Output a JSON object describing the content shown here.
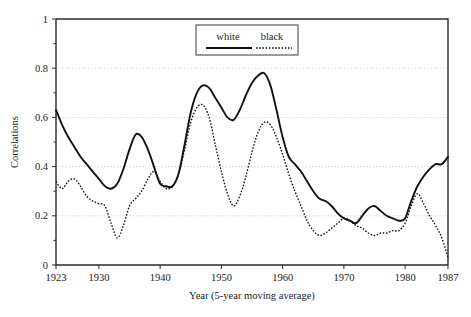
{
  "chart_data": {
    "type": "line",
    "title": "",
    "xlabel": "Year (5-year moving average)",
    "ylabel": "Correlations",
    "xlim": [
      1923,
      1987
    ],
    "ylim": [
      0,
      1
    ],
    "grid": true,
    "legend_position": "top-center",
    "xticks": [
      1923,
      1930,
      1940,
      1950,
      1960,
      1970,
      1980,
      1987
    ],
    "xtick_labels": [
      "1923",
      "1930",
      "1940",
      "1950",
      "1960",
      "1970",
      "1980",
      "1987"
    ],
    "yticks": [
      0,
      0.2,
      0.4,
      0.6,
      0.8,
      1
    ],
    "ytick_labels": [
      "0",
      "0.2",
      "0.4",
      "0.6",
      "0.8",
      "1"
    ],
    "x": [
      1923,
      1924,
      1925,
      1926,
      1927,
      1928,
      1929,
      1930,
      1931,
      1932,
      1933,
      1934,
      1935,
      1936,
      1937,
      1938,
      1939,
      1940,
      1941,
      1942,
      1943,
      1944,
      1945,
      1946,
      1947,
      1948,
      1949,
      1950,
      1951,
      1952,
      1953,
      1954,
      1955,
      1956,
      1957,
      1958,
      1959,
      1960,
      1961,
      1962,
      1963,
      1964,
      1965,
      1966,
      1967,
      1968,
      1969,
      1970,
      1971,
      1972,
      1973,
      1974,
      1975,
      1976,
      1977,
      1978,
      1979,
      1980,
      1981,
      1982,
      1983,
      1984,
      1985,
      1986,
      1987
    ],
    "series": [
      {
        "name": "white",
        "style": "solid",
        "color": "#111111",
        "values": [
          0.63,
          0.57,
          0.52,
          0.48,
          0.44,
          0.41,
          0.38,
          0.35,
          0.32,
          0.31,
          0.33,
          0.39,
          0.47,
          0.53,
          0.52,
          0.47,
          0.4,
          0.33,
          0.32,
          0.32,
          0.37,
          0.49,
          0.62,
          0.7,
          0.73,
          0.72,
          0.68,
          0.64,
          0.6,
          0.59,
          0.63,
          0.69,
          0.74,
          0.77,
          0.78,
          0.73,
          0.63,
          0.52,
          0.44,
          0.41,
          0.38,
          0.34,
          0.3,
          0.27,
          0.26,
          0.24,
          0.21,
          0.19,
          0.18,
          0.17,
          0.2,
          0.23,
          0.24,
          0.22,
          0.2,
          0.19,
          0.18,
          0.19,
          0.26,
          0.32,
          0.36,
          0.39,
          0.41,
          0.41,
          0.44
        ]
      },
      {
        "name": "black",
        "style": "dotted",
        "color": "#111111",
        "values": [
          0.34,
          0.31,
          0.34,
          0.35,
          0.32,
          0.28,
          0.26,
          0.25,
          0.24,
          0.17,
          0.11,
          0.16,
          0.24,
          0.27,
          0.3,
          0.35,
          0.38,
          0.34,
          0.31,
          0.32,
          0.37,
          0.47,
          0.58,
          0.64,
          0.65,
          0.6,
          0.49,
          0.38,
          0.29,
          0.24,
          0.28,
          0.36,
          0.46,
          0.54,
          0.58,
          0.57,
          0.52,
          0.45,
          0.37,
          0.3,
          0.24,
          0.18,
          0.14,
          0.12,
          0.13,
          0.15,
          0.17,
          0.19,
          0.18,
          0.16,
          0.15,
          0.13,
          0.12,
          0.13,
          0.13,
          0.14,
          0.14,
          0.17,
          0.24,
          0.29,
          0.25,
          0.2,
          0.16,
          0.11,
          0.03
        ]
      }
    ],
    "legend": [
      {
        "label": "white",
        "style": "solid"
      },
      {
        "label": "black",
        "style": "dotted"
      }
    ]
  },
  "axes": {
    "ylabel": "Correlations",
    "xlabel": "Year (5-year moving average)",
    "ytick_0": "0",
    "ytick_1": "0.2",
    "ytick_2": "0.4",
    "ytick_3": "0.6",
    "ytick_4": "0.8",
    "ytick_5": "1",
    "xtick_0": "1923",
    "xtick_1": "1930",
    "xtick_2": "1940",
    "xtick_3": "1950",
    "xtick_4": "1960",
    "xtick_5": "1970",
    "xtick_6": "1980",
    "xtick_7": "1987"
  },
  "legend": {
    "white_label": "white",
    "black_label": "black"
  },
  "colors": {
    "line": "#111111",
    "frame": "#2b2b2b",
    "grid": "#b9b9b9",
    "background": "#ffffff"
  }
}
